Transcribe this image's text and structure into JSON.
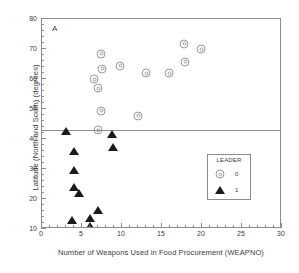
{
  "chart_data": {
    "type": "scatter",
    "title": "",
    "panel_label": "A",
    "xlabel": "Number of Weapons Used in Food Procurement (WEAPNO)",
    "ylabel": "Latitude (North and South) (degrees)",
    "xlim": [
      0,
      30
    ],
    "ylim": [
      10,
      80
    ],
    "xticks": [
      0,
      5,
      10,
      15,
      20,
      25,
      30
    ],
    "yticks": [
      10,
      20,
      30,
      40,
      50,
      60,
      70,
      80
    ],
    "x_minor_step": 1,
    "y_minor_step": 2,
    "grid": false,
    "legend": {
      "title": "LEADER",
      "position": "inside-lower-right",
      "entries": [
        {
          "label": "0",
          "marker": "bullseye-circle"
        },
        {
          "label": "1",
          "marker": "filled-triangle"
        }
      ]
    },
    "annotations": [
      {
        "type": "horizontal-line",
        "y": 43,
        "color": "#8d8d8d"
      }
    ],
    "series": [
      {
        "name": "0",
        "marker": "bullseye-circle",
        "color": "#9a9a9a",
        "points": [
          {
            "x": 6.5,
            "y": 60.0
          },
          {
            "x": 7.0,
            "y": 57.0
          },
          {
            "x": 7.4,
            "y": 68.5
          },
          {
            "x": 7.5,
            "y": 63.5
          },
          {
            "x": 7.4,
            "y": 49.5
          },
          {
            "x": 7.0,
            "y": 43.0
          },
          {
            "x": 9.8,
            "y": 64.5
          },
          {
            "x": 12.0,
            "y": 47.8
          },
          {
            "x": 13.0,
            "y": 62.0
          },
          {
            "x": 15.9,
            "y": 62.0
          },
          {
            "x": 17.8,
            "y": 71.8
          },
          {
            "x": 17.9,
            "y": 65.8
          },
          {
            "x": 19.9,
            "y": 70.0
          }
        ]
      },
      {
        "name": "1",
        "marker": "filled-triangle",
        "color": "#1a1a1a",
        "points": [
          {
            "x": 3.0,
            "y": 42.8
          },
          {
            "x": 4.0,
            "y": 36.0
          },
          {
            "x": 4.0,
            "y": 29.6
          },
          {
            "x": 4.0,
            "y": 23.9
          },
          {
            "x": 3.8,
            "y": 13.1
          },
          {
            "x": 4.6,
            "y": 21.9
          },
          {
            "x": 6.0,
            "y": 13.8
          },
          {
            "x": 6.0,
            "y": 11.1
          },
          {
            "x": 7.0,
            "y": 16.2
          },
          {
            "x": 8.8,
            "y": 41.8
          },
          {
            "x": 8.9,
            "y": 37.2
          }
        ]
      }
    ]
  }
}
